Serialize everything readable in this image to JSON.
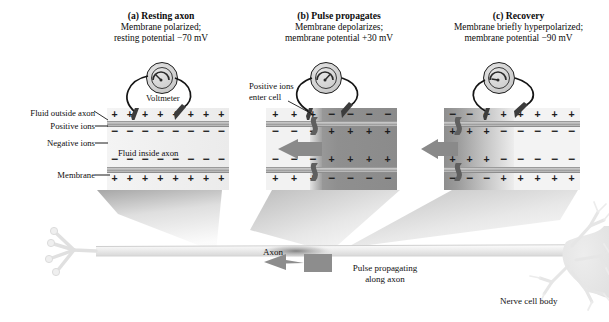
{
  "figure": {
    "title_axon_label": "Axon",
    "pulse_label_line1": "Pulse propagating",
    "pulse_label_line2": "along axon",
    "cell_body_label": "Nerve cell body"
  },
  "panels": [
    {
      "id": "a",
      "title": "(a) Resting axon",
      "sub_line1": "Membrane polarized;",
      "sub_line2": "resting potential −70 mV",
      "voltmeter_label": "Voltmeter",
      "state": "resting",
      "outer_top_row": [
        "+",
        "+",
        "+",
        "+",
        "+",
        "+",
        "+",
        "+"
      ],
      "inner_top_row": [
        "−",
        "−",
        "−",
        "−",
        "−",
        "−",
        "−",
        "−"
      ],
      "inner_bottom_row": [
        "−",
        "−",
        "−",
        "−",
        "−",
        "−",
        "−",
        "−"
      ],
      "outer_bottom_row": [
        "+",
        "+",
        "+",
        "+",
        "+",
        "+",
        "+",
        "+"
      ],
      "callouts": [
        {
          "name": "fluid-outside-axon",
          "text": "Fluid outside axon"
        },
        {
          "name": "positive-ions",
          "text": "Positive ions"
        },
        {
          "name": "negative-ions",
          "text": "Negative ions"
        },
        {
          "name": "fluid-inside-axon",
          "text": "Fluid inside axon"
        },
        {
          "name": "membrane",
          "text": "Membrane"
        }
      ]
    },
    {
      "id": "b",
      "title": "(b) Pulse propagates",
      "sub_line1": "Membrane depolarizes;",
      "sub_line2": "membrane potential +30 mV",
      "state": "depolarized",
      "callout_line1": "Positive ions",
      "callout_line2": "enter cell",
      "outer_top_row": [
        "+",
        "+",
        "+",
        "−",
        "−",
        "−",
        "−"
      ],
      "inner_top_row": [
        "−",
        "−",
        "−",
        "+",
        "+",
        "+",
        "+"
      ],
      "inner_bottom_row": [
        "−",
        "−",
        "−",
        "+",
        "+",
        "+",
        "+"
      ],
      "outer_bottom_row": [
        "+",
        "+",
        "+",
        "−",
        "−",
        "−",
        "−"
      ]
    },
    {
      "id": "c",
      "title": "(c) Recovery",
      "sub_line1": "Membrane briefly hyperpolarized;",
      "sub_line2": "membrane potential −90 mV",
      "state": "hyperpolarized",
      "outer_top_row": [
        "−",
        "−",
        "−",
        "+",
        "+",
        "+",
        "+",
        "+"
      ],
      "inner_top_row": [
        "+",
        "+",
        "+",
        "−",
        "−",
        "−",
        "−",
        "−"
      ],
      "inner_bottom_row": [
        "+",
        "+",
        "+",
        "−",
        "−",
        "−",
        "−",
        "−"
      ],
      "outer_bottom_row": [
        "−",
        "−",
        "−",
        "+",
        "+",
        "+",
        "+",
        "+"
      ]
    }
  ],
  "colors": {
    "ink": "#0d0d0d",
    "membrane_band": "#b4b4b4",
    "fluid_light": "#f2f2f2",
    "fluid_dark": "#9a9a9a",
    "arrow_gray": "#8c8c8c",
    "neuron_gray": "#e8e8e8"
  },
  "chart_data": {
    "type": "diagram",
    "stages": [
      {
        "label": "(a) Resting axon",
        "membrane_potential_mV": -70,
        "state": "polarized",
        "outside_charge": "+",
        "inside_charge": "−"
      },
      {
        "label": "(b) Pulse propagates",
        "membrane_potential_mV": 30,
        "state": "depolarized",
        "outside_charge": "−",
        "inside_charge": "+"
      },
      {
        "label": "(c) Recovery",
        "membrane_potential_mV": -90,
        "state": "hyperpolarized",
        "outside_charge": "+",
        "inside_charge": "−"
      }
    ],
    "propagation_direction": "right-to-left (toward axon terminals)",
    "annotations": [
      "Voltmeter",
      "Positive ions enter cell",
      "Fluid outside axon",
      "Fluid inside axon",
      "Membrane",
      "Axon",
      "Pulse propagating along axon",
      "Nerve cell body"
    ]
  }
}
